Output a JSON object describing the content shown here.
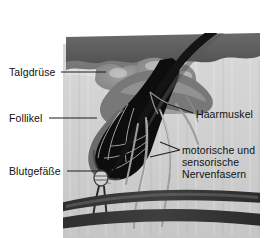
{
  "figure": {
    "type": "anatomical-illustration",
    "background_color": "#ffffff",
    "text_color": "#111111",
    "palette": {
      "hair_shaft": "#1a1a1a",
      "skin_surface": "#5d5d5d",
      "dermis": "#cfcfcf",
      "follicle_cavity": "#0d0d0d",
      "sebaceous_gland": "#8c8c8c",
      "muscle": "#6f6f6f",
      "nerve_fiber": "#9a9a9a",
      "blood_vessel": "#3a3a3a",
      "leader_line": "#222222"
    }
  },
  "labels": {
    "sebaceous_gland": "Talgdrüse",
    "follicle": "Follikel",
    "blood_vessels": "Blutgefäße",
    "hair_muscle": "Haarmuskel",
    "nerve_fibers_line1": "motorische und",
    "nerve_fibers_line2": "sensorische",
    "nerve_fibers_line3": "Nervenfasern"
  }
}
